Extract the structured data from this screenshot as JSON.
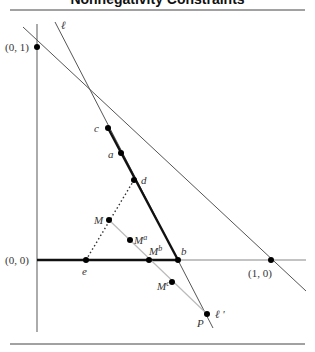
{
  "title": "Nonnegativity Constraints",
  "labels": {
    "origin": "(0, 0)",
    "y_unit": "(0, 1)",
    "x_unit": "(1, 0)",
    "line_l": "ℓ",
    "line_l_prime": "ℓ '",
    "c": "c",
    "a": "a",
    "d": "d",
    "b": "b",
    "e": "e",
    "M": "M",
    "Ma_base": "M",
    "Ma_sup": "a",
    "Mb_base": "M",
    "Mb_sup": "b",
    "Mc_base": "M",
    "Mc_sup": "c",
    "P": "P"
  },
  "colors": {
    "thick_line": "#111111",
    "thin_line": "#555555",
    "light_line": "#bbbbbb",
    "axis": "#888888",
    "rule": "#444444"
  }
}
